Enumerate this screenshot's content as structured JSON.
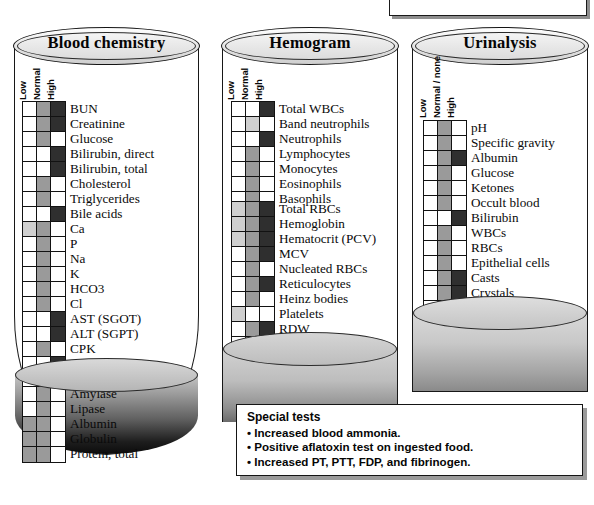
{
  "figure": {
    "column_headers_default": [
      "Low",
      "Normal",
      "High"
    ],
    "shading_legend": {
      "none": "white / not indicated",
      "light": "light gray",
      "mid": "medium gray",
      "dark": "dark gray / black"
    }
  },
  "panels": [
    {
      "id": "blood-chemistry",
      "title": "Blood chemistry",
      "headers": [
        "Low",
        "Normal",
        "High"
      ],
      "groups": [
        {
          "rows": [
            {
              "label": "BUN",
              "cells": [
                "none",
                "mid",
                "dark"
              ]
            },
            {
              "label": "Creatinine",
              "cells": [
                "none",
                "mid",
                "dark"
              ]
            },
            {
              "label": "Glucose",
              "cells": [
                "none",
                "mid",
                "none"
              ]
            },
            {
              "label": "Bilirubin, direct",
              "cells": [
                "none",
                "none",
                "dark"
              ]
            },
            {
              "label": "Bilirubin, total",
              "cells": [
                "none",
                "none",
                "dark"
              ]
            },
            {
              "label": "Cholesterol",
              "cells": [
                "none",
                "mid",
                "none"
              ]
            },
            {
              "label": "Triglycerides",
              "cells": [
                "none",
                "mid",
                "none"
              ]
            },
            {
              "label": "Bile acids",
              "cells": [
                "none",
                "none",
                "dark"
              ]
            },
            {
              "label": "Ca",
              "cells": [
                "light",
                "mid",
                "none"
              ]
            },
            {
              "label": "P",
              "cells": [
                "none",
                "mid",
                "none"
              ]
            },
            {
              "label": "Na",
              "cells": [
                "none",
                "mid",
                "none"
              ]
            },
            {
              "label": "K",
              "cells": [
                "none",
                "mid",
                "none"
              ]
            },
            {
              "label": "HCO3",
              "cells": [
                "none",
                "mid",
                "none"
              ]
            },
            {
              "label": "Cl",
              "cells": [
                "none",
                "mid",
                "none"
              ]
            },
            {
              "label": "AST (SGOT)",
              "cells": [
                "none",
                "none",
                "dark"
              ]
            },
            {
              "label": "ALT (SGPT)",
              "cells": [
                "none",
                "none",
                "dark"
              ]
            },
            {
              "label": "CPK",
              "cells": [
                "none",
                "mid",
                "none"
              ]
            },
            {
              "label": "GGT",
              "cells": [
                "none",
                "none",
                "dark"
              ]
            },
            {
              "label": "Alkaline phosphatase",
              "cells": [
                "none",
                "none",
                "dark"
              ]
            },
            {
              "label": "Amylase",
              "cells": [
                "none",
                "mid",
                "none"
              ]
            },
            {
              "label": "Lipase",
              "cells": [
                "none",
                "mid",
                "none"
              ]
            },
            {
              "label": "Albumin",
              "cells": [
                "mid",
                "mid",
                "none"
              ]
            },
            {
              "label": "Globulin",
              "cells": [
                "mid",
                "mid",
                "none"
              ]
            },
            {
              "label": "Protein, total",
              "cells": [
                "mid",
                "mid",
                "none"
              ]
            }
          ]
        }
      ]
    },
    {
      "id": "hemogram",
      "title": "Hemogram",
      "headers": [
        "Low",
        "Normal",
        "High"
      ],
      "groups": [
        {
          "rows": [
            {
              "label": "Total WBCs",
              "cells": [
                "none",
                "none",
                "dark"
              ]
            },
            {
              "label": "Band neutrophils",
              "cells": [
                "none",
                "light",
                "none"
              ]
            },
            {
              "label": "Neutrophils",
              "cells": [
                "none",
                "none",
                "dark"
              ]
            },
            {
              "label": "Lymphocytes",
              "cells": [
                "none",
                "mid",
                "none"
              ]
            },
            {
              "label": "Monocytes",
              "cells": [
                "none",
                "mid",
                "none"
              ]
            },
            {
              "label": "Eosinophils",
              "cells": [
                "none",
                "mid",
                "none"
              ]
            },
            {
              "label": "Basophils",
              "cells": [
                "none",
                "mid",
                "none"
              ]
            }
          ]
        },
        {
          "rows": [
            {
              "label": "Total RBCs",
              "cells": [
                "light",
                "mid",
                "dark"
              ]
            },
            {
              "label": "Hemoglobin",
              "cells": [
                "light",
                "mid",
                "dark"
              ]
            },
            {
              "label": "Hematocrit (PCV)",
              "cells": [
                "light",
                "mid",
                "dark"
              ]
            },
            {
              "label": "MCV",
              "cells": [
                "none",
                "mid",
                "dark"
              ]
            },
            {
              "label": "Nucleated RBCs",
              "cells": [
                "none",
                "mid",
                "none"
              ]
            },
            {
              "label": "Reticulocytes",
              "cells": [
                "none",
                "mid",
                "dark"
              ]
            },
            {
              "label": "Heinz bodies",
              "cells": [
                "none",
                "mid",
                "none"
              ]
            },
            {
              "label": "Platelets",
              "cells": [
                "light",
                "none",
                "none"
              ]
            },
            {
              "label": "RDW",
              "cells": [
                "none",
                "mid",
                "dark"
              ]
            },
            {
              "label": "MPV",
              "cells": [
                "none",
                "mid",
                "none"
              ]
            }
          ]
        }
      ]
    },
    {
      "id": "urinalysis",
      "title": "Urinalysis",
      "headers": [
        "Low",
        "Normal / none",
        "High"
      ],
      "groups": [
        {
          "rows": [
            {
              "label": "pH",
              "cells": [
                "none",
                "mid",
                "none"
              ]
            },
            {
              "label": "Specific gravity",
              "cells": [
                "none",
                "mid",
                "none"
              ]
            },
            {
              "label": "Albumin",
              "cells": [
                "none",
                "mid",
                "dark"
              ]
            },
            {
              "label": "Glucose",
              "cells": [
                "none",
                "mid",
                "none"
              ]
            },
            {
              "label": "Ketones",
              "cells": [
                "none",
                "mid",
                "none"
              ]
            },
            {
              "label": "Occult blood",
              "cells": [
                "none",
                "mid",
                "none"
              ]
            },
            {
              "label": "Bilirubin",
              "cells": [
                "none",
                "none",
                "dark"
              ]
            },
            {
              "label": "WBCs",
              "cells": [
                "none",
                "mid",
                "none"
              ]
            },
            {
              "label": "RBCs",
              "cells": [
                "none",
                "mid",
                "none"
              ]
            },
            {
              "label": "Epithelial cells",
              "cells": [
                "none",
                "mid",
                "none"
              ]
            },
            {
              "label": "Casts",
              "cells": [
                "none",
                "mid",
                "dark"
              ]
            },
            {
              "label": "Crystals",
              "cells": [
                "none",
                "mid",
                "dark"
              ]
            },
            {
              "label": "Bacteria",
              "cells": [
                "none",
                "mid",
                "none"
              ]
            }
          ]
        }
      ]
    }
  ],
  "special_tests": {
    "title": "Special tests",
    "items": [
      "• Increased blood ammonia.",
      "• Positive aflatoxin test on ingested food.",
      "• Increased PT, PTT, FDP, and fibrinogen."
    ]
  }
}
